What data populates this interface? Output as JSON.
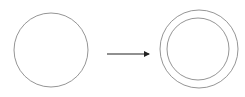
{
  "diagram": {
    "stroke_color": "#7a7a7a",
    "arrow_color": "#222222",
    "background": "#ffffff",
    "elements": {
      "source_circle": {
        "cx": 51,
        "cy": 50,
        "r": 37
      },
      "arrow": {
        "x1": 107,
        "y1": 54,
        "x2": 149,
        "y2": 54
      },
      "target_outer_circle": {
        "cx": 199,
        "cy": 49,
        "r": 39
      },
      "target_inner_circle": {
        "cx": 198,
        "cy": 49,
        "r": 31
      }
    }
  }
}
